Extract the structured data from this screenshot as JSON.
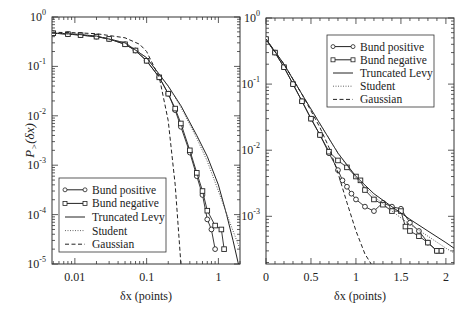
{
  "chart_data": [
    {
      "type": "line",
      "panel": "left",
      "xscale": "log",
      "yscale": "log",
      "xlabel": "δx (points)",
      "ylabel": "P>(δx)",
      "xlim": [
        0.0048,
        2.0
      ],
      "ylim": [
        1e-05,
        1
      ],
      "xticks": [
        "0.01",
        "0.1",
        "1"
      ],
      "yticks": [
        "10^0",
        "10^-1",
        "10^-2",
        "10^-3",
        "10^-4",
        "10^-5"
      ],
      "legend_position": "lower left",
      "legend": [
        "Bund positive",
        "Bund negative",
        "Truncated Levy",
        "Student",
        "Gaussian"
      ],
      "series": [
        {
          "name": "Bund positive",
          "marker": "circle",
          "x": [
            0.005,
            0.008,
            0.012,
            0.02,
            0.03,
            0.05,
            0.07,
            0.1,
            0.15,
            0.2,
            0.25,
            0.3,
            0.4,
            0.5,
            0.6,
            0.7,
            0.8,
            0.9
          ],
          "y": [
            0.47,
            0.45,
            0.43,
            0.4,
            0.36,
            0.28,
            0.21,
            0.13,
            0.06,
            0.028,
            0.013,
            0.006,
            0.0018,
            0.0006,
            0.00025,
            8e-05,
            5e-05,
            2e-05
          ]
        },
        {
          "name": "Bund negative",
          "marker": "square",
          "x": [
            0.005,
            0.008,
            0.012,
            0.02,
            0.03,
            0.05,
            0.07,
            0.1,
            0.15,
            0.2,
            0.25,
            0.3,
            0.4,
            0.5,
            0.6,
            0.7,
            0.9,
            1.1,
            1.2
          ],
          "y": [
            0.47,
            0.45,
            0.43,
            0.4,
            0.36,
            0.28,
            0.21,
            0.13,
            0.06,
            0.028,
            0.014,
            0.007,
            0.002,
            0.0007,
            0.0003,
            0.00012,
            6e-05,
            5e-05,
            2e-05
          ]
        },
        {
          "name": "Truncated Levy",
          "style": "solid",
          "x": [
            0.0048,
            0.01,
            0.02,
            0.05,
            0.1,
            0.2,
            0.3,
            0.5,
            0.7,
            1.0,
            1.3,
            1.6,
            1.9
          ],
          "y": [
            0.47,
            0.45,
            0.41,
            0.3,
            0.15,
            0.04,
            0.016,
            0.004,
            0.0015,
            0.0004,
            0.0001,
            3e-05,
            1e-05
          ]
        },
        {
          "name": "Student",
          "style": "dotted",
          "x": [
            0.0048,
            0.01,
            0.02,
            0.05,
            0.1,
            0.2,
            0.3,
            0.5,
            0.7,
            1.0,
            1.5,
            2.0
          ],
          "y": [
            0.47,
            0.45,
            0.41,
            0.3,
            0.15,
            0.04,
            0.015,
            0.0035,
            0.0012,
            0.0003,
            6e-05,
            2e-05
          ]
        },
        {
          "name": "Gaussian",
          "style": "dashed",
          "x": [
            0.0048,
            0.01,
            0.02,
            0.05,
            0.08,
            0.1,
            0.15,
            0.2,
            0.25,
            0.3
          ],
          "y": [
            0.49,
            0.48,
            0.46,
            0.38,
            0.28,
            0.2,
            0.06,
            0.008,
            0.0004,
            1e-05
          ]
        }
      ]
    },
    {
      "type": "line",
      "panel": "right",
      "xscale": "linear",
      "yscale": "log",
      "xlabel": "δx (points)",
      "ylabel": "",
      "xlim": [
        0,
        2.09
      ],
      "ylim": [
        0.00019,
        1
      ],
      "xticks": [
        "0",
        "0.5",
        "1",
        "1.5",
        "2"
      ],
      "yticks": [
        "10^0",
        "10^-1",
        "10^-2",
        "10^-3"
      ],
      "legend_position": "upper right",
      "legend": [
        "Bund positive",
        "Bund negative",
        "Truncated Levy",
        "Student",
        "Gaussian"
      ],
      "series": [
        {
          "name": "Bund positive",
          "marker": "circle",
          "x": [
            0.0,
            0.1,
            0.2,
            0.3,
            0.4,
            0.5,
            0.6,
            0.7,
            0.8,
            0.85,
            0.9,
            0.95,
            1.0,
            1.1,
            1.2,
            1.3,
            1.4,
            1.5,
            1.6,
            1.7,
            1.8,
            1.9,
            1.95
          ],
          "y": [
            0.48,
            0.3,
            0.18,
            0.1,
            0.055,
            0.03,
            0.017,
            0.009,
            0.005,
            0.0035,
            0.0028,
            0.0022,
            0.0018,
            0.0014,
            0.0012,
            0.0016,
            0.0014,
            0.0013,
            0.0008,
            0.0006,
            0.0004,
            0.0003,
            0.0003
          ]
        },
        {
          "name": "Bund negative",
          "marker": "square",
          "x": [
            0.0,
            0.1,
            0.2,
            0.3,
            0.4,
            0.5,
            0.6,
            0.7,
            0.8,
            0.9,
            1.0,
            1.05,
            1.1,
            1.2,
            1.3,
            1.4,
            1.5,
            1.55,
            1.6,
            1.7,
            1.8,
            1.9,
            1.95
          ],
          "y": [
            0.48,
            0.3,
            0.18,
            0.1,
            0.055,
            0.03,
            0.017,
            0.0095,
            0.007,
            0.0055,
            0.004,
            0.0035,
            0.0025,
            0.0018,
            0.0015,
            0.0012,
            0.0012,
            0.0007,
            0.0006,
            0.0005,
            0.0004,
            0.0003,
            0.0003
          ]
        },
        {
          "name": "Truncated Levy",
          "style": "solid",
          "x": [
            0.0,
            0.2,
            0.4,
            0.6,
            0.8,
            1.0,
            1.2,
            1.4,
            1.6,
            1.8,
            2.0,
            2.09
          ],
          "y": [
            0.48,
            0.2,
            0.07,
            0.025,
            0.009,
            0.004,
            0.0022,
            0.0014,
            0.0009,
            0.0006,
            0.0004,
            0.00033
          ]
        },
        {
          "name": "Student",
          "style": "dotted",
          "x": [
            0.0,
            0.2,
            0.4,
            0.6,
            0.8,
            1.0,
            1.2,
            1.4,
            1.6,
            1.8,
            2.0,
            2.09
          ],
          "y": [
            0.48,
            0.2,
            0.07,
            0.025,
            0.009,
            0.0038,
            0.002,
            0.0012,
            0.00075,
            0.0005,
            0.00033,
            0.00028
          ]
        },
        {
          "name": "Gaussian",
          "style": "dashed",
          "x": [
            0.0,
            0.2,
            0.4,
            0.6,
            0.7,
            0.8,
            0.9,
            1.0,
            1.1,
            1.17
          ],
          "y": [
            0.48,
            0.2,
            0.07,
            0.022,
            0.011,
            0.0045,
            0.0016,
            0.0006,
            0.00027,
            0.00019
          ]
        }
      ]
    }
  ]
}
